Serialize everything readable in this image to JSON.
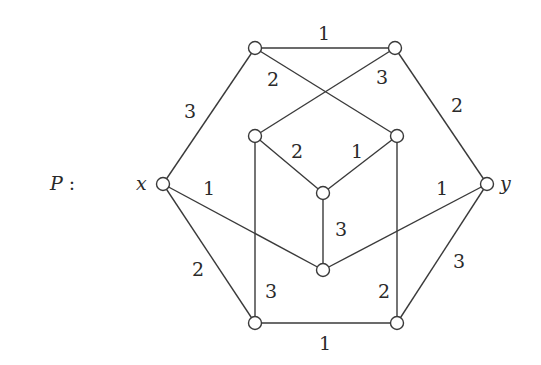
{
  "graph": {
    "name": "P",
    "title_label": "P :",
    "nodes": [
      {
        "id": "x",
        "label": "x",
        "cx": 163,
        "cy": 184
      },
      {
        "id": "y",
        "label": "y",
        "cx": 487,
        "cy": 184
      },
      {
        "id": "tl",
        "label": "",
        "cx": 255,
        "cy": 48
      },
      {
        "id": "tr",
        "label": "",
        "cx": 395,
        "cy": 48
      },
      {
        "id": "il",
        "label": "",
        "cx": 255,
        "cy": 136
      },
      {
        "id": "ir",
        "label": "",
        "cx": 397,
        "cy": 136
      },
      {
        "id": "c",
        "label": "",
        "cx": 323,
        "cy": 193
      },
      {
        "id": "bc",
        "label": "",
        "cx": 323,
        "cy": 270
      },
      {
        "id": "bl",
        "label": "",
        "cx": 255,
        "cy": 323
      },
      {
        "id": "br",
        "label": "",
        "cx": 397,
        "cy": 323
      }
    ],
    "edges": [
      {
        "from": "tl",
        "to": "tr",
        "weight": "1"
      },
      {
        "from": "x",
        "to": "tl",
        "weight": "3"
      },
      {
        "from": "tr",
        "to": "y",
        "weight": "2"
      },
      {
        "from": "tl",
        "to": "ir",
        "weight": "2"
      },
      {
        "from": "tr",
        "to": "il",
        "weight": "3"
      },
      {
        "from": "il",
        "to": "c",
        "weight": "2"
      },
      {
        "from": "ir",
        "to": "c",
        "weight": "1"
      },
      {
        "from": "c",
        "to": "bc",
        "weight": "3"
      },
      {
        "from": "x",
        "to": "bc",
        "weight": "1"
      },
      {
        "from": "y",
        "to": "bc",
        "weight": "1"
      },
      {
        "from": "x",
        "to": "bl",
        "weight": "2"
      },
      {
        "from": "y",
        "to": "br",
        "weight": "3"
      },
      {
        "from": "il",
        "to": "bl",
        "weight": "3"
      },
      {
        "from": "ir",
        "to": "br",
        "weight": "2"
      },
      {
        "from": "bl",
        "to": "br",
        "weight": "1"
      }
    ],
    "weight_labels": [
      {
        "text": "1",
        "x": 324,
        "y": 40
      },
      {
        "text": "3",
        "x": 190,
        "y": 118
      },
      {
        "text": "2",
        "x": 273,
        "y": 86
      },
      {
        "text": "3",
        "x": 382,
        "y": 84
      },
      {
        "text": "2",
        "x": 457,
        "y": 112
      },
      {
        "text": "2",
        "x": 297,
        "y": 158
      },
      {
        "text": "1",
        "x": 357,
        "y": 158
      },
      {
        "text": "3",
        "x": 341,
        "y": 236
      },
      {
        "text": "1",
        "x": 209,
        "y": 195
      },
      {
        "text": "1",
        "x": 442,
        "y": 195
      },
      {
        "text": "2",
        "x": 198,
        "y": 276
      },
      {
        "text": "3",
        "x": 459,
        "y": 268
      },
      {
        "text": "3",
        "x": 271,
        "y": 298
      },
      {
        "text": "2",
        "x": 384,
        "y": 298
      },
      {
        "text": "1",
        "x": 325,
        "y": 350
      }
    ],
    "var_labels": [
      {
        "text": "x",
        "x": 136,
        "y": 190
      },
      {
        "text": "y",
        "x": 500,
        "y": 190
      }
    ]
  }
}
